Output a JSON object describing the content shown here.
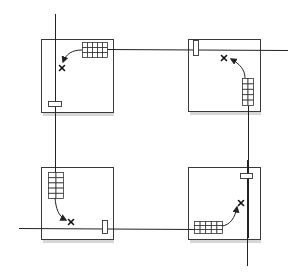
{
  "diagram": {
    "title": "",
    "colors": {
      "stroke": "#222222",
      "panel_fill": "#ffffff",
      "shadow": "#bdbdbd",
      "background": "#ffffff"
    },
    "panels": [
      {
        "id": "top-left",
        "grid": {
          "cols": 5,
          "rows": 3,
          "orientation": "horizontal"
        },
        "slot": "horizontal",
        "arrow_direction": "from-grid-to-x",
        "target": "x-mark"
      },
      {
        "id": "top-right",
        "grid": {
          "cols": 2,
          "rows": 5,
          "orientation": "vertical"
        },
        "slot": "vertical",
        "arrow_direction": "from-grid-to-x",
        "target": "x-mark"
      },
      {
        "id": "bottom-left",
        "grid": {
          "cols": 2,
          "rows": 5,
          "orientation": "vertical"
        },
        "slot": "vertical",
        "arrow_direction": "from-grid-to-x",
        "target": "x-mark"
      },
      {
        "id": "bottom-right",
        "grid": {
          "cols": 5,
          "rows": 3,
          "orientation": "horizontal"
        },
        "slot": "horizontal",
        "arrow_direction": "from-grid-to-x",
        "target": "x-mark"
      }
    ],
    "icons": {
      "target": "x-mark-icon",
      "arrow": "curved-arrow-icon"
    }
  }
}
